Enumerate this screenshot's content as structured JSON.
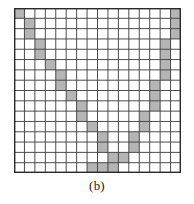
{
  "figure": {
    "caption": "(b)",
    "label": "b"
  },
  "grid": {
    "rows": 16,
    "cols": 16,
    "cell_size": 10.4,
    "origin_x": 14,
    "origin_y": 8,
    "width": 167,
    "height": 165,
    "line_color": "#3a3a3a",
    "line_width": 0.9,
    "border_color": "#2a2a2a",
    "border_width": 1.4,
    "cell_fill": "#ffffff",
    "shaded_fill": "#b5b5b5",
    "background": "#ffffff"
  },
  "shaded_cells": [
    [
      0,
      0
    ],
    [
      1,
      1
    ],
    [
      2,
      1
    ],
    [
      3,
      2
    ],
    [
      4,
      2
    ],
    [
      5,
      3
    ],
    [
      6,
      4
    ],
    [
      7,
      4
    ],
    [
      8,
      5
    ],
    [
      9,
      6
    ],
    [
      10,
      6
    ],
    [
      11,
      7
    ],
    [
      12,
      8
    ],
    [
      13,
      8
    ],
    [
      14,
      9
    ],
    [
      15,
      7
    ],
    [
      15,
      8
    ],
    [
      15,
      9
    ],
    [
      14,
      10
    ],
    [
      13,
      11
    ],
    [
      12,
      11
    ],
    [
      11,
      12
    ],
    [
      10,
      12
    ],
    [
      9,
      13
    ],
    [
      8,
      13
    ],
    [
      7,
      13
    ],
    [
      6,
      14
    ],
    [
      5,
      14
    ],
    [
      4,
      14
    ],
    [
      3,
      14
    ],
    [
      2,
      15
    ],
    [
      1,
      15
    ],
    [
      0,
      15
    ]
  ],
  "colors": {
    "shaded": "#b5b5b5",
    "grid_line": "#3a3a3a",
    "caption_text": "#1a1a1a",
    "page_background": "#ffffff"
  }
}
